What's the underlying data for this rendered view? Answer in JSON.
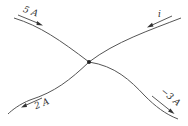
{
  "diagram": {
    "type": "circuit-junction",
    "node": {
      "x": 89,
      "y": 62
    },
    "branches": [
      {
        "id": "top-left",
        "label": "5 A",
        "direction": "into-node"
      },
      {
        "id": "top-right",
        "label": "i",
        "direction": "into-node"
      },
      {
        "id": "bottom-left",
        "label": "2 A",
        "direction": "out-of-node"
      },
      {
        "id": "bottom-right",
        "label": "−3 A",
        "direction": "out-of-node"
      }
    ]
  }
}
